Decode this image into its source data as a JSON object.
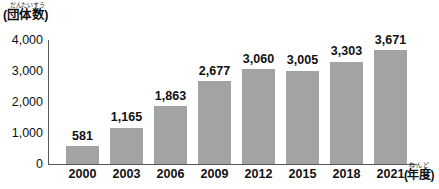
{
  "chart_data": {
    "type": "bar",
    "title": "",
    "categories": [
      "2000",
      "2003",
      "2006",
      "2009",
      "2012",
      "2015",
      "2018",
      "2021"
    ],
    "values": [
      581,
      1165,
      1863,
      2677,
      3060,
      3005,
      3303,
      3671
    ],
    "value_labels": [
      "581",
      "1,165",
      "1,863",
      "2,677",
      "3,060",
      "3,005",
      "3,303",
      "3,671"
    ],
    "xlabel": "(年度)",
    "xlabel_furigana": "ねんど",
    "ylabel": "(団体数)",
    "ylabel_furigana": "だんたいすう",
    "ylim": [
      0,
      4000
    ],
    "yticks": [
      0,
      1000,
      2000,
      3000,
      4000
    ],
    "ytick_labels": [
      "0",
      "1,000",
      "2,000",
      "3,000",
      "4,000"
    ],
    "grid": false,
    "legend": false,
    "bar_color": "#a2a3a3",
    "axis_color": "#55585a",
    "text_color": "#111111"
  }
}
